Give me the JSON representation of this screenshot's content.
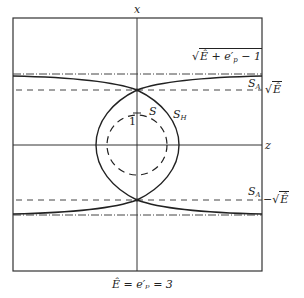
{
  "diagram": {
    "axes": {
      "vertical_label": "x",
      "horizontal_label": "z"
    },
    "unit_tick_label": "1",
    "curves": {
      "S": "S",
      "S_H": {
        "main": "S",
        "sub": "H"
      },
      "S_A_top": {
        "main": "S",
        "sub": "A"
      },
      "S_A_bottom": {
        "main": "S",
        "sub": "A"
      }
    },
    "levels": {
      "top_dashdot": {
        "prefix": "",
        "radicand": "Ê + e′",
        "sub": "p",
        "suffix": " − 1"
      },
      "top_dashed": {
        "prefix": "",
        "radicand": "Ê"
      },
      "bottom_dashed": {
        "prefix": "−",
        "radicand": "Ê"
      }
    },
    "caption": "Ê = e′ₚ = 3",
    "colors": {
      "ink": "#222222",
      "background": "#ffffff"
    }
  }
}
